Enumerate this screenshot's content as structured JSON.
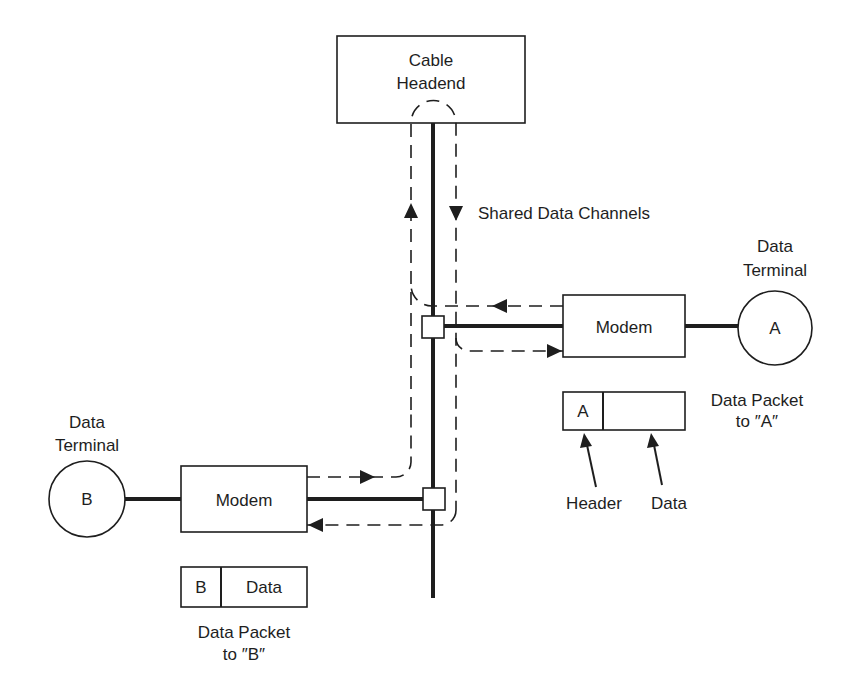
{
  "diagram": {
    "headend": {
      "line1": "Cable",
      "line2": "Headend"
    },
    "channels_label": "Shared Data Channels",
    "terminal_a": {
      "label_line1": "Data",
      "label_line2": "Terminal",
      "id": "A"
    },
    "terminal_b": {
      "label_line1": "Data",
      "label_line2": "Terminal",
      "id": "B"
    },
    "modem_a": {
      "label": "Modem"
    },
    "modem_b": {
      "label": "Modem"
    },
    "packet_a": {
      "header": "A",
      "data": "",
      "caption_line1": "Data Packet",
      "caption_line2": "to ″A″",
      "header_pointer": "Header",
      "data_pointer": "Data"
    },
    "packet_b": {
      "header": "B",
      "data": "Data",
      "caption_line1": "Data Packet",
      "caption_line2": "to ″B″"
    },
    "colors": {
      "ink": "#1e1e1e",
      "background": "#ffffff"
    }
  }
}
